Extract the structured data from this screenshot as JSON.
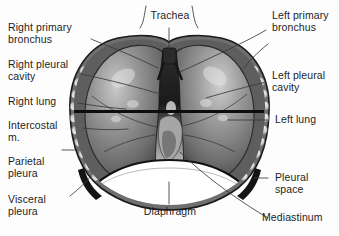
{
  "figure": {
    "background_color": "#fdfdfd",
    "text_color": "#1d1d1d",
    "leader_color": "#3a3a3a"
  },
  "labels": {
    "right_primary_bronchus": "Right primary\nbronchus",
    "right_pleural_cavity": "Right pleural\ncavity",
    "right_lung": "Right lung",
    "intercostal_m": "Intercostal\nm.",
    "parietal_pleura": "Parietal\npleura",
    "visceral_pleura": "Visceral\npleura",
    "trachea": "Trachea",
    "diaphragm": "Diaphragm",
    "left_primary_bronchus": "Left primary\nbronchus",
    "left_pleural_cavity": "Left pleural\ncavity",
    "left_lung": "Left lung",
    "pleural_space": "Pleural\nspace",
    "mediastinum": "Mediastinum"
  },
  "artwork": {
    "type": "grayscale-anatomical-illustration",
    "subject": "human thorax with both lungs, ribcage, mediastinum and diaphragm",
    "lung_fill": "#8a8a8a",
    "lung_shadow": "#4a4a4a",
    "lung_highlight": "#d2d2d2",
    "rib_color": "#e8e6e2",
    "mediastinum_color": "#262626",
    "diaphragm_color": "#ffffff",
    "horizontal_rule_color": "#0d0d0d"
  }
}
